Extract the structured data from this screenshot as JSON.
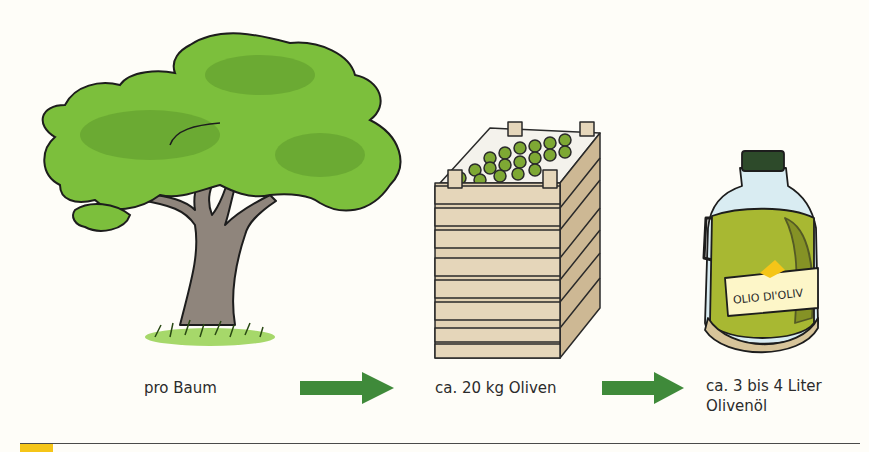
{
  "steps": [
    {
      "label": "pro Baum",
      "illustration": "olive-tree"
    },
    {
      "label": "ca. 20 kg Oliven",
      "illustration": "crate-of-olives"
    },
    {
      "label_line1": "ca. 3 bis 4 Liter",
      "label_line2": "Olivenöl",
      "illustration": "olive-oil-bottle"
    }
  ],
  "bottle_label": "OLIO DI'OLIV",
  "arrows": [
    {
      "icon": "arrow-right-icon"
    },
    {
      "icon": "arrow-right-icon"
    }
  ],
  "colors": {
    "arrow": "#3f8a3a",
    "foliage": "#7cbf3c",
    "trunk": "#8b7d72",
    "crate": "#e2d2b4",
    "oil": "#a8b832",
    "accent": "#f5c518",
    "rule": "#4a4a4a"
  }
}
